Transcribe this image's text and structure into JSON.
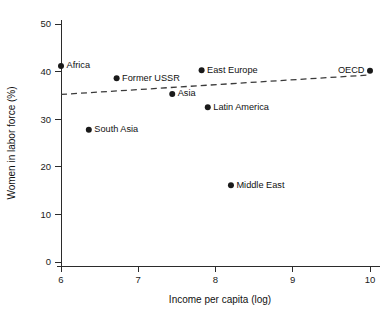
{
  "chart_data": {
    "type": "scatter",
    "title": "",
    "subtitle": "",
    "xlabel": "Income per capita (log)",
    "ylabel": "Women in labor force (%)",
    "xlim": [
      6,
      10
    ],
    "ylim": [
      0,
      50
    ],
    "xticks": [
      6,
      7,
      8,
      9,
      10
    ],
    "xticklabels": [
      "6",
      "7",
      "8",
      "9",
      "10"
    ],
    "yticks": [
      0,
      10,
      20,
      30,
      40,
      50
    ],
    "yticklabels": [
      "0",
      "10",
      "20",
      "30",
      "40",
      "50"
    ],
    "grid": false,
    "legend": "none",
    "marker_color": "#1a1a1a",
    "trendline_color": "#3a3a3a",
    "points": [
      {
        "label": "Africa",
        "x": 6.0,
        "y": 41.2,
        "label_side": "right"
      },
      {
        "label": "South Asia",
        "x": 6.36,
        "y": 27.8,
        "label_side": "right"
      },
      {
        "label": "Former USSR",
        "x": 6.72,
        "y": 38.6,
        "label_side": "right"
      },
      {
        "label": "Asia",
        "x": 7.44,
        "y": 35.3,
        "label_side": "right"
      },
      {
        "label": "East Europe",
        "x": 7.82,
        "y": 40.3,
        "label_side": "right"
      },
      {
        "label": "Latin America",
        "x": 7.9,
        "y": 32.5,
        "label_side": "right"
      },
      {
        "label": "Middle East",
        "x": 8.2,
        "y": 16.1,
        "label_side": "right"
      },
      {
        "label": "OECD",
        "x": 10.0,
        "y": 40.2,
        "label_side": "left"
      }
    ],
    "trendline": {
      "style": "dashed",
      "x_start": 6.0,
      "y_start": 35.2,
      "x_end": 10.0,
      "y_end": 39.3
    }
  }
}
